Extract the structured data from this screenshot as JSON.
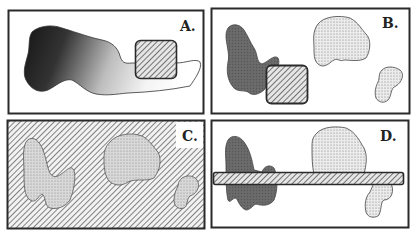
{
  "figure": {
    "panels": [
      {
        "id": "A",
        "label": "A.",
        "description": "gradient blob with overlapping hatched square"
      },
      {
        "id": "B",
        "label": "B.",
        "description": "dark blob, stippled blobs, hatched square"
      },
      {
        "id": "C",
        "label": "C.",
        "description": "hatched background with stippled blobs"
      },
      {
        "id": "D",
        "label": "D.",
        "description": "blobs crossed by hatched horizontal bar"
      }
    ],
    "colors": {
      "border": "#2a2a2a",
      "gradient_dark": "#1a1a1a",
      "gradient_light": "#ffffff",
      "dark_blob": "#6a6a6a",
      "stipple_fill": "#e4e4e4",
      "hatch_bg": "#dedede",
      "hatch_line": "#555555"
    }
  }
}
